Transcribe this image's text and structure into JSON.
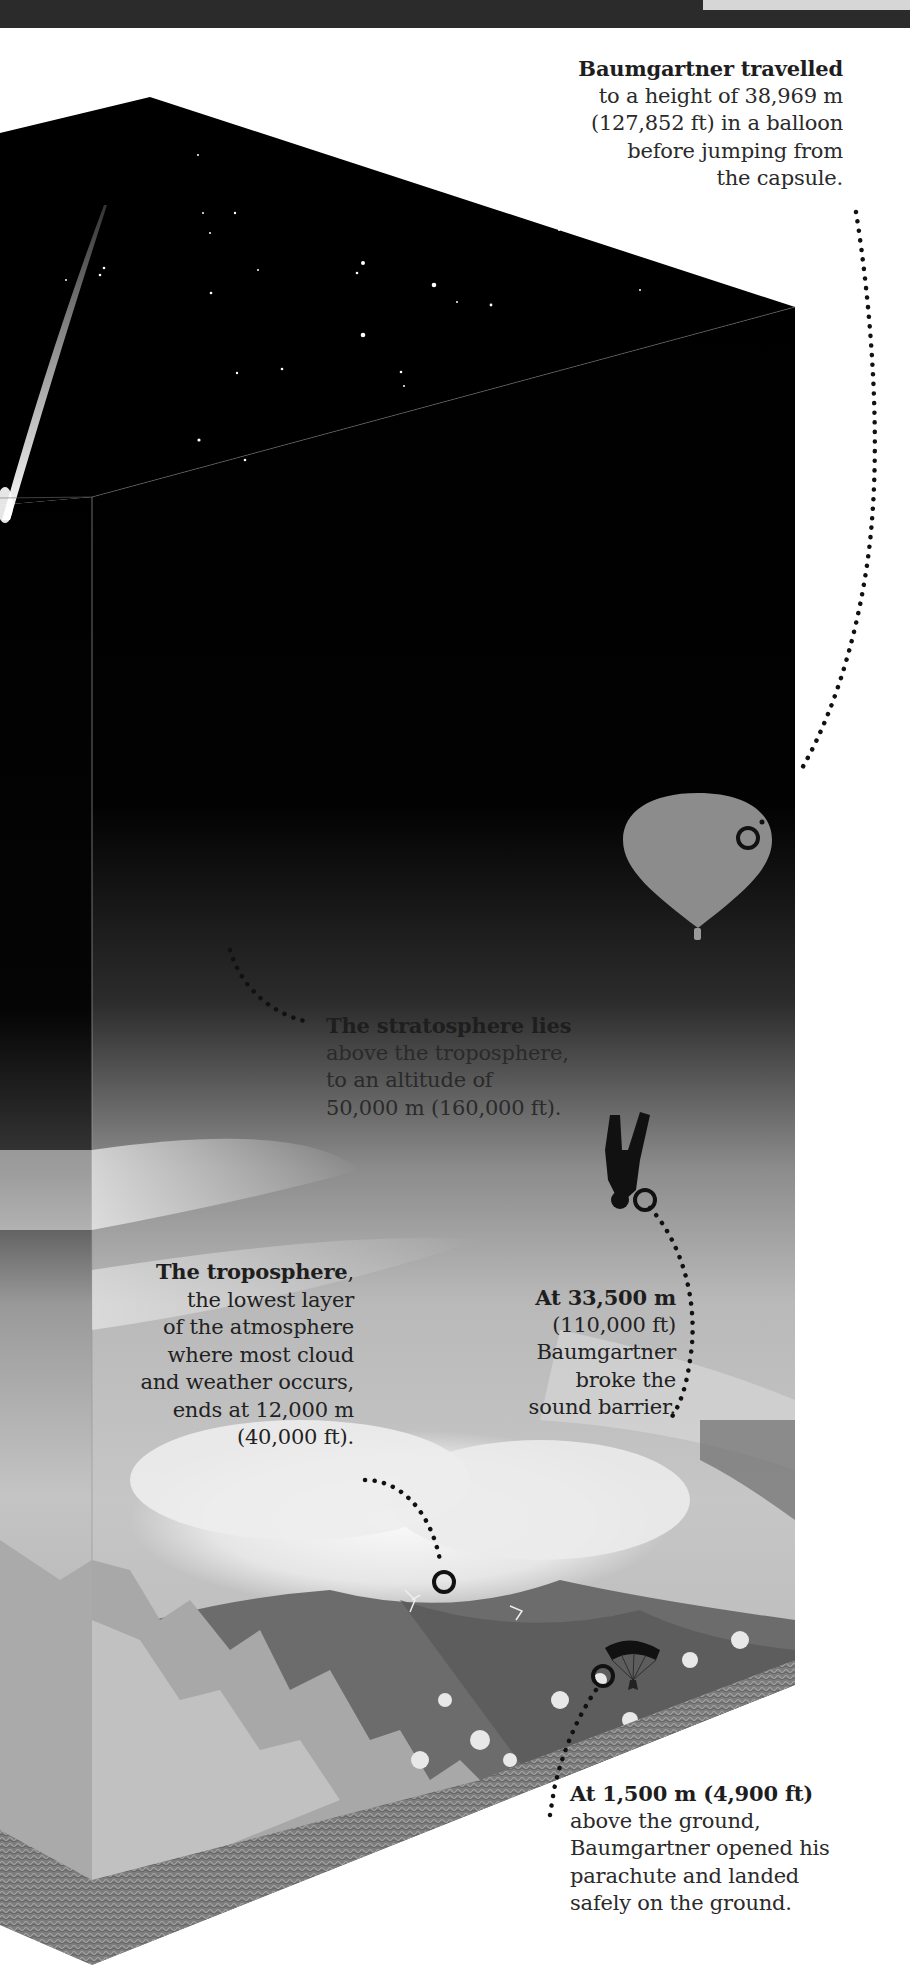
{
  "page": {
    "colors": {
      "space": "#000000",
      "sky_light": "#b8b8b8",
      "balloon": "#8a8a8a",
      "marker": "#111111",
      "text": "#2a2a2a",
      "background": "#ffffff"
    }
  },
  "annotations": {
    "balloon_height": {
      "lines": [
        {
          "text": "Baumgartner travelled",
          "bold": true
        },
        {
          "text": "to a height of 38,969 m",
          "bold": false
        },
        {
          "text": "(127,852 ft) in a balloon",
          "bold": false
        },
        {
          "text": "before jumping from",
          "bold": false
        },
        {
          "text": "the capsule.",
          "bold": false
        }
      ]
    },
    "stratosphere": {
      "lines": [
        {
          "text": "The stratosphere lies",
          "bold": true
        },
        {
          "text": "above the troposphere,",
          "bold": false
        },
        {
          "text": "to an altitude of",
          "bold": false
        },
        {
          "text": "50,000 m (160,000 ft).",
          "bold": false
        }
      ]
    },
    "sound_barrier": {
      "lines": [
        {
          "text": "At 33,500 m",
          "bold": true
        },
        {
          "text": "(110,000 ft)",
          "bold": false
        },
        {
          "text": "Baumgartner",
          "bold": false
        },
        {
          "text": "broke the",
          "bold": false
        },
        {
          "text": "sound barrier.",
          "bold": false
        }
      ]
    },
    "troposphere": {
      "bold_lead": "The troposphere",
      "lead_suffix": ",",
      "lines": [
        {
          "text": "the lowest layer",
          "bold": false
        },
        {
          "text": "of the atmosphere",
          "bold": false
        },
        {
          "text": "where most cloud",
          "bold": false
        },
        {
          "text": "and weather occurs,",
          "bold": false
        },
        {
          "text": "ends at 12,000 m",
          "bold": false
        },
        {
          "text": "(40,000 ft).",
          "bold": false
        }
      ]
    },
    "parachute": {
      "lines": [
        {
          "text": "At 1,500 m (4,900 ft)",
          "bold": true
        },
        {
          "text": "above the ground,",
          "bold": false
        },
        {
          "text": "Baumgartner opened his",
          "bold": false
        },
        {
          "text": "parachute and landed",
          "bold": false
        },
        {
          "text": "safely on the ground.",
          "bold": false
        }
      ]
    }
  },
  "icons": {
    "balloon": "balloon-icon",
    "skydiver": "skydiver-icon",
    "parachute": "parachute-icon",
    "marker": "ring-marker-icon"
  }
}
